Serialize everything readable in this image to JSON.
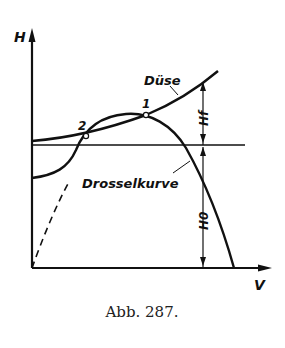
{
  "figure": {
    "caption": "Abb. 287.",
    "axes": {
      "y_label": "H",
      "x_label": "V"
    },
    "curves": {
      "nozzle_label": "Düse",
      "throttle_label": "Drosselkurve"
    },
    "points": {
      "p1": "1",
      "p2": "2"
    },
    "dimensions": {
      "upper": "Hf",
      "lower": "H0"
    },
    "colors": {
      "ink": "#111111",
      "background": "#ffffff"
    }
  }
}
